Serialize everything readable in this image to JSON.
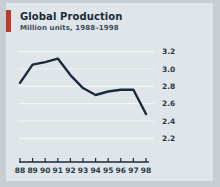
{
  "card": {
    "title": "Global Production",
    "subtitle": "Million units, 1988–1998",
    "accent_color": "#c0392b",
    "background_color": "#dfe5e8",
    "outer_background_color": "#c9ced2"
  },
  "chart_data": {
    "type": "line",
    "title": "Global Production",
    "subtitle": "Million units, 1988–1998",
    "xlabel": "",
    "ylabel": "",
    "categories": [
      "88",
      "89",
      "90",
      "91",
      "92",
      "93",
      "94",
      "95",
      "96",
      "97",
      "98"
    ],
    "x": [
      1988,
      1989,
      1990,
      1991,
      1992,
      1993,
      1994,
      1995,
      1996,
      1997,
      1998
    ],
    "values": [
      2.84,
      3.05,
      3.08,
      3.12,
      2.93,
      2.78,
      2.7,
      2.74,
      2.76,
      2.76,
      2.48
    ],
    "series": [
      {
        "name": "Global Production",
        "values": [
          2.84,
          3.05,
          3.08,
          3.12,
          2.93,
          2.78,
          2.7,
          2.74,
          2.76,
          2.76,
          2.48
        ],
        "color": "#1b2a3d"
      }
    ],
    "ylim": [
      2.1,
      3.3
    ],
    "yticks": [
      2.2,
      2.4,
      2.6,
      2.8,
      3.0,
      3.2
    ],
    "ytick_labels": [
      "2.2",
      "2.4",
      "2.6",
      "2.8",
      "3.0",
      "3.2"
    ],
    "grid": true,
    "grid_color": "#f2f5f6",
    "legend": false,
    "line_color": "#1b2a3d",
    "line_width": 2.4,
    "axis_color": "#1b2a3d"
  }
}
